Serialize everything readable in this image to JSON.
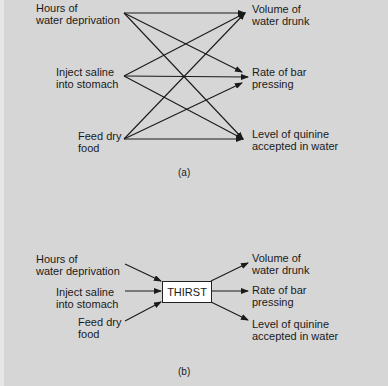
{
  "panel_a": {
    "inputs": [
      {
        "line1": "Hours of",
        "line2": "water deprivation"
      },
      {
        "line1": "Inject saline",
        "line2": "into stomach"
      },
      {
        "line1": "Feed dry",
        "line2": "food"
      }
    ],
    "outputs": [
      {
        "line1": "Volume of",
        "line2": "water drunk"
      },
      {
        "line1": "Rate of bar",
        "line2": "pressing"
      },
      {
        "line1": "Level of quinine",
        "line2": "accepted in water"
      }
    ],
    "caption": "(a)"
  },
  "panel_b": {
    "inputs": [
      {
        "line1": "Hours of",
        "line2": "water deprivation"
      },
      {
        "line1": "Inject saline",
        "line2": "into stomach"
      },
      {
        "line1": "Feed dry",
        "line2": "food"
      }
    ],
    "intervening_variable": "THIRST",
    "outputs": [
      {
        "line1": "Volume of",
        "line2": "water drunk"
      },
      {
        "line1": "Rate of bar",
        "line2": "pressing"
      },
      {
        "line1": "Level of quinine",
        "line2": "accepted in water"
      }
    ],
    "caption": "(b)"
  },
  "colors": {
    "background": "#d6d6d6",
    "line": "#1a1a1a",
    "box_fill": "#ffffff"
  }
}
